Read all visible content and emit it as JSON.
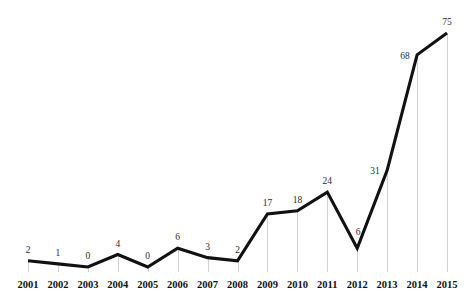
{
  "chart_data": {
    "type": "line",
    "title": "",
    "subtitle": "",
    "xlabel": "",
    "ylabel": "",
    "categories": [
      "2001",
      "2002",
      "2003",
      "2004",
      "2005",
      "2006",
      "2007",
      "2008",
      "2009",
      "2010",
      "2011",
      "2012",
      "2013",
      "2014",
      "2015"
    ],
    "values": [
      2,
      1,
      0,
      4,
      0,
      6,
      3,
      2,
      17,
      18,
      24,
      6,
      31,
      68,
      75
    ],
    "series": [
      {
        "name": "",
        "values": [
          2,
          1,
          0,
          4,
          0,
          6,
          3,
          2,
          17,
          18,
          24,
          6,
          31,
          68,
          75
        ]
      }
    ],
    "data_labels": [
      "2",
      "1",
      "0",
      "4",
      "0",
      "6",
      "3",
      "2",
      "17",
      "18",
      "24",
      "6",
      "31",
      "68",
      "75"
    ],
    "xlim": [
      2001,
      2015
    ],
    "ylim": [
      0,
      75
    ],
    "grid": false,
    "droplines": true,
    "legend": false,
    "legend_position": "none",
    "axis_visible": false,
    "colors": {
      "line": "#111111",
      "dropline": "#d2d2d2",
      "value_label": "#2b2b2b",
      "tick_label": "#111111",
      "background": "#ffffff"
    },
    "label_offsets": {
      "2011": "above",
      "2012": "inside-dip",
      "2013": "left",
      "2014": "left",
      "2015": "above"
    }
  }
}
